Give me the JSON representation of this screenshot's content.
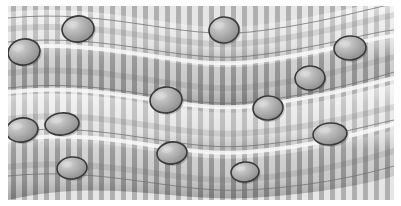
{
  "figure": {
    "title": "Deformed woven mesh with embedded spherical particles",
    "background_color": "#ffffff",
    "canvas_width": 401,
    "canvas_height": 206,
    "render_style": "grayscale-shaded-surface"
  },
  "palette": {
    "background": "#ffffff",
    "mesh_light": "#e4e4e4",
    "mesh_mid": "#c9c9c9",
    "mesh_dark": "#9a9a9a",
    "mesh_darker": "#868686",
    "weft_highlight": "#f2f2f2",
    "seam_line": "#6f6f6f",
    "particle_outline": "#3a3a3a",
    "particle_fill_light": "#c6c6c6",
    "particle_fill_dark": "#8e8e8e"
  },
  "plot_area": {
    "x": 8,
    "y": 6,
    "width": 386,
    "height": 194
  },
  "chart_data": {
    "type": "scatter",
    "title": "Deformed woven mesh with embedded spherical particles",
    "xlabel": "",
    "ylabel": "",
    "xlim": [
      0,
      401
    ],
    "ylim": [
      0,
      206
    ],
    "grid": false,
    "legend": "none",
    "background_field": {
      "kind": "woven-mesh",
      "warp_stripe_period_px": 11,
      "warp_stripe_width_px": 5,
      "weft_band_count": 4,
      "weft_bands": [
        {
          "index": 0,
          "left_y": 18,
          "right_y": 8,
          "amplitude": 10,
          "thickness": 34
        },
        {
          "index": 1,
          "left_y": 62,
          "right_y": 52,
          "amplitude": 13,
          "thickness": 38
        },
        {
          "index": 2,
          "left_y": 108,
          "right_y": 100,
          "amplitude": 12,
          "thickness": 40
        },
        {
          "index": 3,
          "left_y": 156,
          "right_y": 150,
          "amplitude": 11,
          "thickness": 44
        }
      ],
      "seam_curves": [
        {
          "index": 0,
          "y_left": 42,
          "y_right": 30
        },
        {
          "index": 1,
          "y_left": 88,
          "y_right": 72
        },
        {
          "index": 2,
          "y_left": 132,
          "y_right": 120
        },
        {
          "index": 3,
          "y_left": 176,
          "y_right": 166
        }
      ]
    },
    "series": [
      {
        "name": "particles",
        "marker": "ellipse",
        "count": 13,
        "points": [
          {
            "id": "p1",
            "x": 78,
            "y": 29,
            "rx": 16,
            "ry": 13,
            "rotation": -8
          },
          {
            "id": "p2",
            "x": 24,
            "y": 52,
            "rx": 16,
            "ry": 13,
            "rotation": -10
          },
          {
            "id": "p3",
            "x": 224,
            "y": 30,
            "rx": 15,
            "ry": 13,
            "rotation": -6
          },
          {
            "id": "p4",
            "x": 350,
            "y": 48,
            "rx": 16,
            "ry": 12,
            "rotation": -5
          },
          {
            "id": "p5",
            "x": 166,
            "y": 100,
            "rx": 16,
            "ry": 13,
            "rotation": -7
          },
          {
            "id": "p6",
            "x": 310,
            "y": 78,
            "rx": 15,
            "ry": 12,
            "rotation": -4
          },
          {
            "id": "p7",
            "x": 22,
            "y": 130,
            "rx": 16,
            "ry": 12,
            "rotation": -9
          },
          {
            "id": "p8",
            "x": 62,
            "y": 124,
            "rx": 17,
            "ry": 11,
            "rotation": -6
          },
          {
            "id": "p9",
            "x": 330,
            "y": 134,
            "rx": 17,
            "ry": 11,
            "rotation": -5
          },
          {
            "id": "p10",
            "x": 172,
            "y": 153,
            "rx": 15,
            "ry": 11,
            "rotation": -7
          },
          {
            "id": "p11",
            "x": 72,
            "y": 168,
            "rx": 15,
            "ry": 11,
            "rotation": -6
          },
          {
            "id": "p12",
            "x": 245,
            "y": 172,
            "rx": 14,
            "ry": 10,
            "rotation": -5
          },
          {
            "id": "p13",
            "x": 268,
            "y": 108,
            "rx": 15,
            "ry": 12,
            "rotation": -6
          }
        ]
      }
    ]
  }
}
